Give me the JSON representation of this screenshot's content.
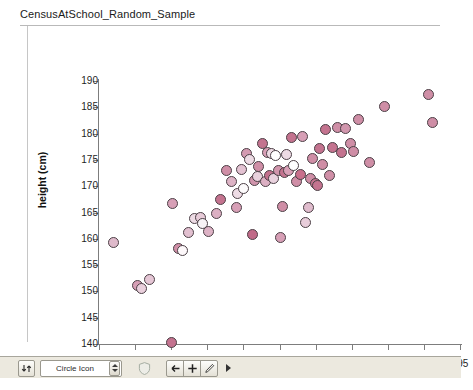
{
  "title": "CensusAtSchool_Random_Sample",
  "chart_data": {
    "type": "scatter",
    "title": "CensusAtSchool_Random_Sample",
    "xlabel": "arm_span (cm)",
    "ylabel": "height (cm)",
    "xlim": [
      145,
      195
    ],
    "ylim": [
      140,
      190
    ],
    "xticks": [
      145,
      150,
      155,
      160,
      165,
      170,
      175,
      180,
      185,
      190,
      195
    ],
    "yticks": [
      140,
      145,
      150,
      155,
      160,
      165,
      170,
      175,
      180,
      185,
      190
    ],
    "grid": false,
    "legend": null,
    "marker": "circle",
    "marker_edge_color": "#4c4046",
    "marker_fill_colors": [
      "#c4738f",
      "#cf8ea6",
      "#dbb1c0",
      "#eddbe3",
      "#ffffff"
    ],
    "points": [
      {
        "x": 147.0,
        "y": 159.3,
        "c": "#dfbacb"
      },
      {
        "x": 150.4,
        "y": 151.2,
        "c": "#d79fb6"
      },
      {
        "x": 150.9,
        "y": 150.6,
        "c": "#e9cfdc"
      },
      {
        "x": 152.0,
        "y": 152.2,
        "c": "#e5c6d5"
      },
      {
        "x": 155.0,
        "y": 140.2,
        "c": "#c4738f"
      },
      {
        "x": 155.2,
        "y": 166.8,
        "c": "#d79fb6"
      },
      {
        "x": 156.0,
        "y": 158.2,
        "c": "#cf8ea6"
      },
      {
        "x": 156.6,
        "y": 157.8,
        "c": "#fdf8fa"
      },
      {
        "x": 157.4,
        "y": 161.2,
        "c": "#e2c0d0"
      },
      {
        "x": 158.2,
        "y": 163.9,
        "c": "#eddbe4"
      },
      {
        "x": 159.0,
        "y": 164.0,
        "c": "#e7cbd8"
      },
      {
        "x": 159.3,
        "y": 163.0,
        "c": "#f7f2f5"
      },
      {
        "x": 160.2,
        "y": 161.4,
        "c": "#ddb2c5"
      },
      {
        "x": 161.3,
        "y": 164.9,
        "c": "#dcb0c3"
      },
      {
        "x": 161.8,
        "y": 167.4,
        "c": "#c4738f"
      },
      {
        "x": 162.7,
        "y": 173.0,
        "c": "#cf8ea6"
      },
      {
        "x": 163.4,
        "y": 170.9,
        "c": "#ddb3c5"
      },
      {
        "x": 164.0,
        "y": 166.0,
        "c": "#d79fb6"
      },
      {
        "x": 164.2,
        "y": 168.7,
        "c": "#eedce5"
      },
      {
        "x": 164.8,
        "y": 173.2,
        "c": "#e3c2d2"
      },
      {
        "x": 165.0,
        "y": 169.6,
        "c": "#fdfbfc"
      },
      {
        "x": 165.4,
        "y": 176.2,
        "c": "#d49ab1"
      },
      {
        "x": 165.9,
        "y": 175.1,
        "c": "#eddbe4"
      },
      {
        "x": 166.2,
        "y": 160.8,
        "c": "#c06a88"
      },
      {
        "x": 166.5,
        "y": 171.1,
        "c": "#d095ac"
      },
      {
        "x": 166.9,
        "y": 171.9,
        "c": "#e9d1dd"
      },
      {
        "x": 167.1,
        "y": 173.7,
        "c": "#cf8ea6"
      },
      {
        "x": 167.6,
        "y": 178.2,
        "c": "#c4738f"
      },
      {
        "x": 168.0,
        "y": 170.9,
        "c": "#dcb0c3"
      },
      {
        "x": 168.3,
        "y": 176.4,
        "c": "#d89fb6"
      },
      {
        "x": 168.6,
        "y": 172.0,
        "c": "#c2708d"
      },
      {
        "x": 168.9,
        "y": 176.2,
        "c": "#eddbe4"
      },
      {
        "x": 169.2,
        "y": 171.4,
        "c": "#e9d2de"
      },
      {
        "x": 169.5,
        "y": 175.9,
        "c": "#ffffff"
      },
      {
        "x": 169.9,
        "y": 172.9,
        "c": "#d195ac"
      },
      {
        "x": 170.1,
        "y": 160.2,
        "c": "#d79fb6"
      },
      {
        "x": 170.4,
        "y": 166.2,
        "c": "#cf8ea6"
      },
      {
        "x": 170.7,
        "y": 172.6,
        "c": "#c4738f"
      },
      {
        "x": 171.0,
        "y": 176.0,
        "c": "#eddbe4"
      },
      {
        "x": 171.3,
        "y": 173.0,
        "c": "#d89fb6"
      },
      {
        "x": 171.7,
        "y": 179.3,
        "c": "#c4738f"
      },
      {
        "x": 172.0,
        "y": 174.0,
        "c": "#ffffff"
      },
      {
        "x": 172.4,
        "y": 170.8,
        "c": "#cf8ea6"
      },
      {
        "x": 172.9,
        "y": 172.3,
        "c": "#c96f8c"
      },
      {
        "x": 173.2,
        "y": 179.4,
        "c": "#d79fb6"
      },
      {
        "x": 173.6,
        "y": 163.1,
        "c": "#e8cdda"
      },
      {
        "x": 174.0,
        "y": 166.0,
        "c": "#e0bccd"
      },
      {
        "x": 174.3,
        "y": 171.4,
        "c": "#cf8ea6"
      },
      {
        "x": 174.6,
        "y": 175.2,
        "c": "#cf8ea6"
      },
      {
        "x": 175.0,
        "y": 170.5,
        "c": "#c4738f"
      },
      {
        "x": 175.3,
        "y": 170.2,
        "c": "#c4738f"
      },
      {
        "x": 175.6,
        "y": 177.2,
        "c": "#c4738f"
      },
      {
        "x": 176.0,
        "y": 174.2,
        "c": "#cf8ea6"
      },
      {
        "x": 176.4,
        "y": 180.8,
        "c": "#c4738f"
      },
      {
        "x": 176.9,
        "y": 172.0,
        "c": "#d08fa7"
      },
      {
        "x": 177.4,
        "y": 177.3,
        "c": "#c4738f"
      },
      {
        "x": 178.0,
        "y": 181.2,
        "c": "#cf8ea6"
      },
      {
        "x": 178.6,
        "y": 176.4,
        "c": "#c4738f"
      },
      {
        "x": 179.2,
        "y": 180.9,
        "c": "#d196ad"
      },
      {
        "x": 179.8,
        "y": 178.2,
        "c": "#cf8ea6"
      },
      {
        "x": 180.3,
        "y": 176.6,
        "c": "#cf8ea6"
      },
      {
        "x": 181.0,
        "y": 182.6,
        "c": "#cf8ea6"
      },
      {
        "x": 182.5,
        "y": 174.5,
        "c": "#cf8ea6"
      },
      {
        "x": 184.5,
        "y": 185.1,
        "c": "#cf8ea6"
      },
      {
        "x": 190.6,
        "y": 187.4,
        "c": "#cf8ea6"
      },
      {
        "x": 191.2,
        "y": 182.2,
        "c": "#cf8ea6"
      }
    ]
  },
  "toolbar": {
    "swap_button_label": "",
    "swap_icon": "swap-arrows-icon",
    "icon_select_value": "Circle Icon",
    "shield_icon": "shield-icon",
    "back_button_label": "←",
    "add_button_label": "+",
    "edit_button_label": "✐",
    "overflow_label": ""
  }
}
